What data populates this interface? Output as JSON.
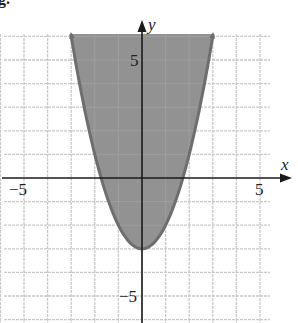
{
  "figure_label": "g.",
  "chart_data": {
    "type": "area",
    "title": "",
    "function": "y = x^2 - 3",
    "inequality": "y >= x^2 - 3",
    "shaded_region": "above the parabola (inside)",
    "boundary": "solid",
    "vertex": [
      0,
      -3
    ],
    "x_intercepts": [
      -1.73,
      1.73
    ],
    "points": [
      [
        -3,
        6
      ],
      [
        -2,
        1
      ],
      [
        -1,
        -2
      ],
      [
        0,
        -3
      ],
      [
        1,
        -2
      ],
      [
        2,
        1
      ],
      [
        3,
        6
      ]
    ],
    "xlabel": "x",
    "ylabel": "y",
    "xlim": [
      -6,
      6
    ],
    "ylim": [
      -6,
      6
    ],
    "x_tick_labels": [
      {
        "value": -5,
        "label": "−5"
      },
      {
        "value": 5,
        "label": "5"
      }
    ],
    "y_tick_labels": [
      {
        "value": 5,
        "label": "5"
      },
      {
        "value": -5,
        "label": "−5"
      }
    ],
    "grid": true,
    "grid_step": 1,
    "colors": {
      "shade": "#8c8c8c",
      "curve": "#6e6e6e",
      "grid": "#c8c8c8",
      "axis": "#1a1a1a"
    }
  }
}
